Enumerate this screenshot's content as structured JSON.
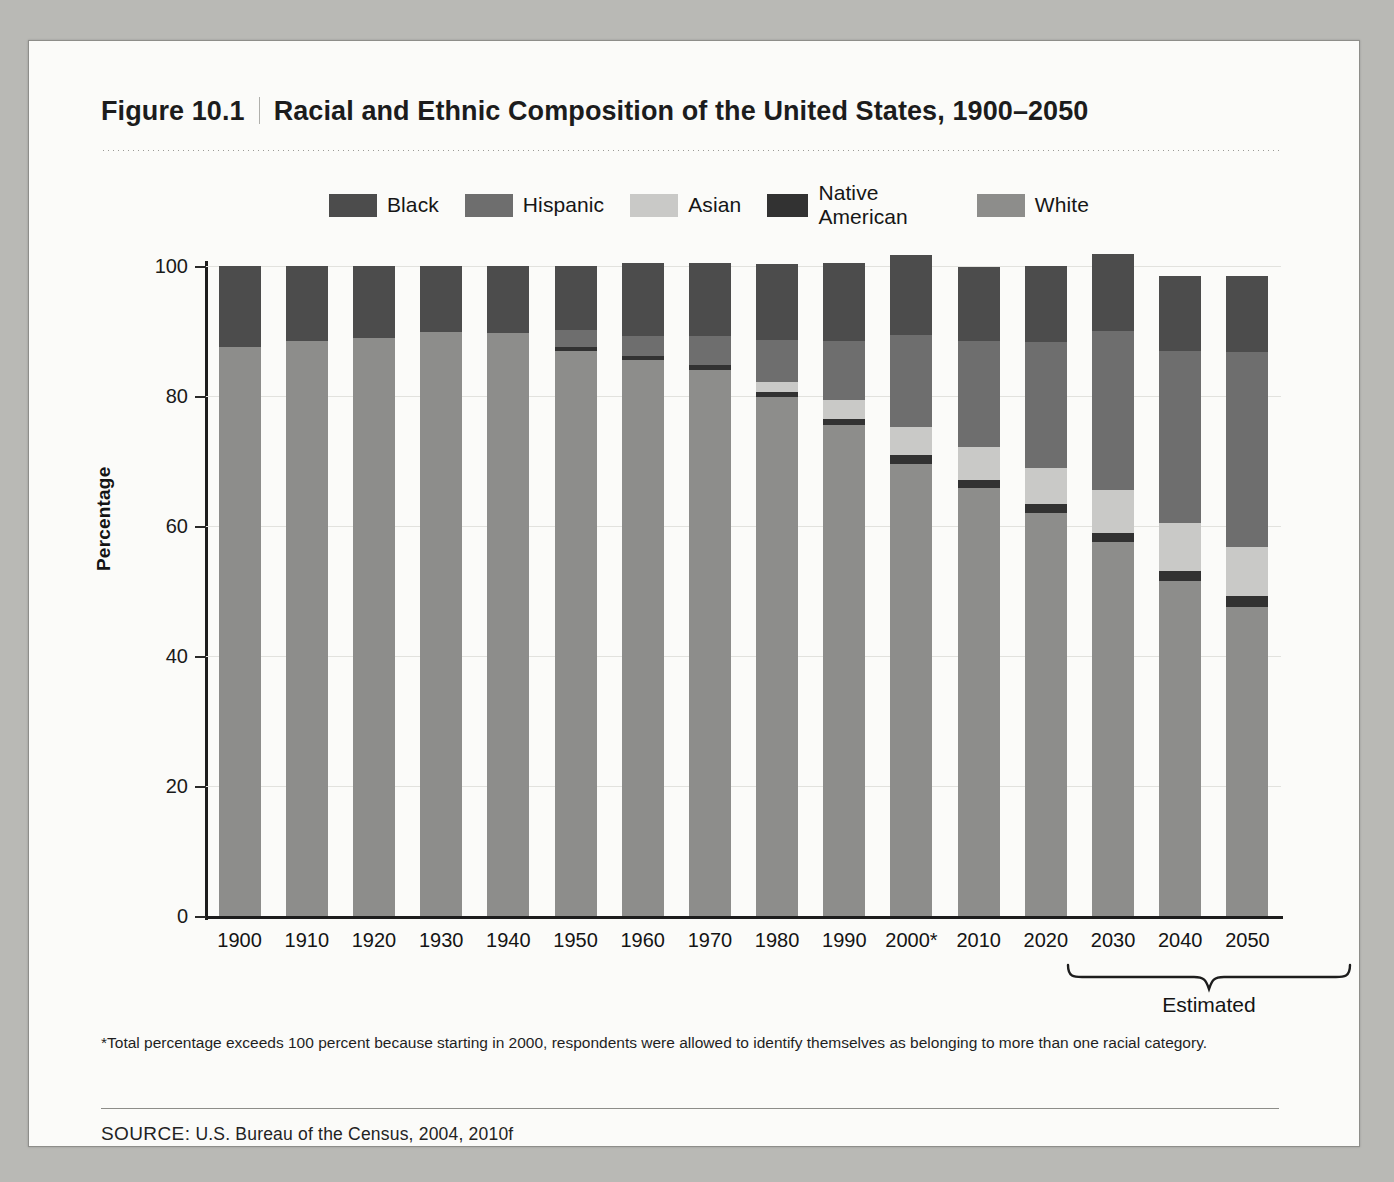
{
  "figure": {
    "number": "Figure 10.1",
    "title": "Racial and Ethnic Composition of the United States, 1900–2050"
  },
  "footnote": "*Total percentage exceeds 100 percent because starting in 2000, respondents were allowed to identify themselves as belonging to more than one racial category.",
  "source_prefix": "SOURCE:",
  "source_text": " U.S. Bureau of the Census, 2004, 2010f",
  "estimated_label": "Estimated",
  "colors": {
    "black": "#4c4c4c",
    "hispanic": "#6e6e6e",
    "asian": "#c9c9c7",
    "native_american": "#323232",
    "white": "#8d8d8b",
    "axis": "#1d1d1d",
    "grid": "#e2e2de",
    "paper": "#fbfbf9",
    "backdrop": "#b9b9b5"
  },
  "chart_data": {
    "type": "bar",
    "stacked": true,
    "title": "Racial and Ethnic Composition of the United States, 1900–2050",
    "xlabel": "",
    "ylabel": "Percentage",
    "ylim": [
      0,
      100
    ],
    "yticks": [
      0,
      20,
      40,
      60,
      80,
      100
    ],
    "grid": true,
    "legend_position": "top",
    "categories": [
      "1900",
      "1910",
      "1920",
      "1930",
      "1940",
      "1950",
      "1960",
      "1970",
      "1980",
      "1990",
      "2000*",
      "2010",
      "2020",
      "2030",
      "2040",
      "2050"
    ],
    "stack_order_bottom_to_top": [
      "White",
      "Native American",
      "Asian",
      "Hispanic",
      "Black"
    ],
    "series": [
      {
        "name": "White",
        "color": "#8d8d8b",
        "values": [
          87.5,
          88.5,
          89.0,
          89.8,
          89.7,
          87.0,
          85.5,
          84.0,
          79.8,
          75.5,
          69.5,
          65.8,
          62.0,
          57.5,
          51.5,
          47.5
        ]
      },
      {
        "name": "Native American",
        "color": "#323232",
        "values": [
          0.0,
          0.0,
          0.0,
          0.0,
          0.0,
          0.6,
          0.6,
          0.7,
          0.8,
          0.9,
          1.5,
          1.3,
          1.4,
          1.5,
          1.6,
          1.8
        ]
      },
      {
        "name": "Asian",
        "color": "#c9c9c7",
        "values": [
          0.0,
          0.0,
          0.0,
          0.0,
          0.0,
          0.0,
          0.0,
          0.0,
          1.6,
          3.0,
          4.2,
          5.0,
          5.5,
          6.5,
          7.3,
          7.5
        ]
      },
      {
        "name": "Hispanic",
        "color": "#6e6e6e",
        "values": [
          0.0,
          0.0,
          0.0,
          0.0,
          0.0,
          2.5,
          3.2,
          4.6,
          6.4,
          9.0,
          14.2,
          16.3,
          19.4,
          24.5,
          26.5,
          30.0
        ]
      },
      {
        "name": "Black",
        "color": "#4c4c4c",
        "values": [
          12.5,
          11.5,
          11.0,
          10.2,
          10.3,
          9.9,
          11.2,
          11.1,
          11.7,
          12.1,
          12.3,
          11.5,
          11.7,
          11.8,
          11.5,
          11.7
        ]
      }
    ],
    "annotations": [
      {
        "text": "Estimated",
        "covers": [
          "2020",
          "2030",
          "2040",
          "2050"
        ]
      }
    ]
  },
  "legend": {
    "items": [
      {
        "label": "Black",
        "color": "#4c4c4c"
      },
      {
        "label": "Hispanic",
        "color": "#6e6e6e"
      },
      {
        "label": "Asian",
        "color": "#c9c9c7"
      },
      {
        "label": "Native American",
        "color": "#323232"
      },
      {
        "label": "White",
        "color": "#8d8d8b"
      }
    ]
  }
}
